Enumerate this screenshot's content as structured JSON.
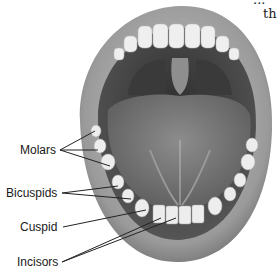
{
  "diagram": {
    "corner_text": [
      "...",
      "th"
    ],
    "labels": [
      {
        "id": "molars",
        "text": "Molars",
        "x": 20,
        "y": 143,
        "anchor": [
          60,
          150
        ],
        "targets": [
          [
            95,
            131
          ],
          [
            98,
            150
          ],
          [
            110,
            166
          ]
        ]
      },
      {
        "id": "bicuspids",
        "text": "Bicuspids",
        "x": 6,
        "y": 186,
        "anchor": [
          62,
          193
        ],
        "targets": [
          [
            118,
            186
          ],
          [
            131,
            199
          ]
        ]
      },
      {
        "id": "cuspid",
        "text": "Cuspid",
        "x": 20,
        "y": 220,
        "anchor": [
          63,
          227
        ],
        "targets": [
          [
            146,
            210
          ]
        ]
      },
      {
        "id": "incisors",
        "text": "Incisors",
        "x": 17,
        "y": 255,
        "anchor": [
          62,
          262
        ],
        "targets": [
          [
            161,
            218
          ],
          [
            176,
            218
          ]
        ]
      }
    ],
    "colors": {
      "lip_outer": "#8a8a8a",
      "lip_inner": "#b5b5b5",
      "mouth_cavity": "#4a4a4a",
      "tongue": "#7a7a7a",
      "tooth": "#eeeeee",
      "line": "#222222"
    }
  }
}
